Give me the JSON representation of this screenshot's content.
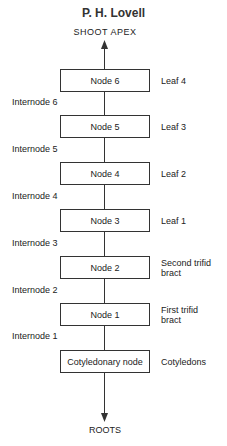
{
  "author": "P. H. Lovell",
  "top_label": "SHOOT APEX",
  "bottom_label": "ROOTS",
  "nodes": [
    {
      "label": "Node  6",
      "organ": "Leaf 4",
      "internode": "Internode 6"
    },
    {
      "label": "Node  5",
      "organ": "Leaf 3",
      "internode": "Internode 5"
    },
    {
      "label": "Node  4",
      "organ": "Leaf 2",
      "internode": "Internode 4"
    },
    {
      "label": "Node  3",
      "organ": "Leaf 1",
      "internode": "Internode 3"
    },
    {
      "label": "Node  2",
      "organ_line1": "Second trifid",
      "organ_line2": "bract",
      "internode": "Internode 2"
    },
    {
      "label": "Node  1",
      "organ_line1": "First trifid",
      "organ_line2": "bract",
      "internode": "Internode 1"
    },
    {
      "label": "Cotyledonary node",
      "organ": "Cotyledons"
    }
  ]
}
